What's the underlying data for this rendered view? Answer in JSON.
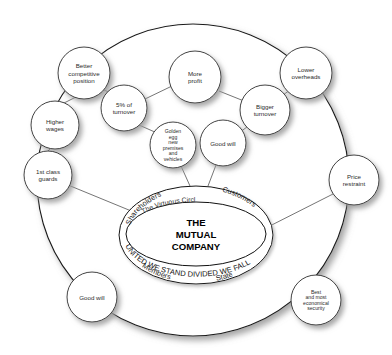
{
  "diagram": {
    "title": "The Virtuous Circle",
    "center": {
      "heading": "The Virtuous Circle",
      "core_line_1": "THE",
      "core_line_2": "MUTUAL",
      "core_line_3": "COMPANY",
      "banner": "UNITED WE STAND DIVIDED WE FALL",
      "stakeholder_top_left": "Shareholders",
      "stakeholder_top_right": "Customers",
      "stakeholder_bottom_left": "Members",
      "stakeholder_bottom_right": "State"
    },
    "colors": {
      "background": "#ffffff",
      "stroke": "#1a1a1a",
      "text": "#222222",
      "shadow": "#b4b4b4"
    },
    "nodes": [
      {
        "id": "better-competitive-position",
        "lines": [
          "Better",
          "competitive",
          "position"
        ],
        "cx": 84,
        "cy": 73,
        "r": 26
      },
      {
        "id": "five-percent-of-turnover",
        "lines": [
          "5% of",
          "turnover"
        ],
        "cx": 124,
        "cy": 108,
        "r": 23
      },
      {
        "id": "more-profit",
        "lines": [
          "More",
          "profit"
        ],
        "cx": 195,
        "cy": 77,
        "r": 26
      },
      {
        "id": "lower-overheads",
        "lines": [
          "Lower",
          "overheads"
        ],
        "cx": 306,
        "cy": 73,
        "r": 26
      },
      {
        "id": "bigger-turnover",
        "lines": [
          "Bigger",
          "turnover"
        ],
        "cx": 265,
        "cy": 110,
        "r": 25
      },
      {
        "id": "higher-wages",
        "lines": [
          "Higher",
          "wages"
        ],
        "cx": 55,
        "cy": 125,
        "r": 24
      },
      {
        "id": "golden-egg-new-premises-and-vehicles",
        "lines": [
          "Golden",
          "egg",
          "new",
          "premises",
          "and",
          "vehicles"
        ],
        "cx": 173,
        "cy": 145,
        "r": 23,
        "tiny": true
      },
      {
        "id": "good-will-upper",
        "lines": [
          "Good will"
        ],
        "cx": 223,
        "cy": 143,
        "r": 23
      },
      {
        "id": "first-class-guards",
        "lines": [
          "1st class",
          "guards"
        ],
        "cx": 48,
        "cy": 175,
        "r": 24
      },
      {
        "id": "price-restraint",
        "lines": [
          "Price",
          "restraint"
        ],
        "cx": 354,
        "cy": 180,
        "r": 25
      },
      {
        "id": "good-will-lower",
        "lines": [
          "Good will"
        ],
        "cx": 92,
        "cy": 297,
        "r": 25
      },
      {
        "id": "best-and-most-economical-security",
        "lines": [
          "Best",
          "and most",
          "economical",
          "security"
        ],
        "cx": 316,
        "cy": 300,
        "r": 25,
        "tiny": true
      }
    ],
    "connections": [
      {
        "id": "better-to-higher-wages",
        "x1": 76,
        "y1": 97,
        "x2": 64,
        "y2": 103
      },
      {
        "id": "better-to-five-percent",
        "x1": 104,
        "y1": 90,
        "x2": 111,
        "y2": 93
      },
      {
        "id": "five-percent-to-more-profit",
        "x1": 145,
        "y1": 99,
        "x2": 172,
        "y2": 86
      },
      {
        "id": "five-percent-to-golden-egg",
        "x1": 139,
        "y1": 125,
        "x2": 157,
        "y2": 133
      },
      {
        "id": "more-profit-to-bigger-turnover",
        "x1": 219,
        "y1": 91,
        "x2": 244,
        "y2": 101
      },
      {
        "id": "bigger-turnover-to-lower-overheads",
        "x1": 283,
        "y1": 95,
        "x2": 290,
        "y2": 90
      },
      {
        "id": "bigger-turnover-to-good-will",
        "x1": 247,
        "y1": 127,
        "x2": 240,
        "y2": 132
      },
      {
        "id": "higher-wages-to-guards",
        "x1": 50,
        "y1": 149,
        "x2": 48,
        "y2": 151
      },
      {
        "id": "golden-egg-to-ellipse",
        "x1": 181,
        "y1": 166,
        "x2": 190,
        "y2": 186
      },
      {
        "id": "good-will-to-ellipse",
        "x1": 216,
        "y1": 165,
        "x2": 208,
        "y2": 186
      },
      {
        "id": "guards-to-ellipse",
        "x1": 68,
        "y1": 185,
        "x2": 197,
        "y2": 238
      },
      {
        "id": "price-restraint-to-ellipse",
        "x1": 333,
        "y1": 194,
        "x2": 250,
        "y2": 236
      }
    ]
  }
}
